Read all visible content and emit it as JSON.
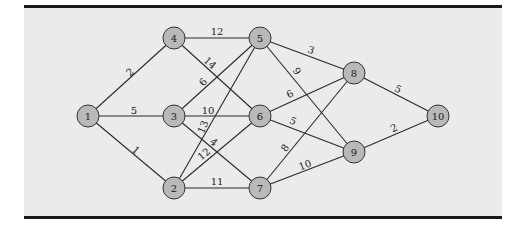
{
  "diagram": {
    "type": "network-graph",
    "colors": {
      "background": "#ebebeb",
      "node_fill": "#b9b9b9",
      "node_stroke": "#333333",
      "edge": "#2a2a2a",
      "rule": "#1a1a1a"
    },
    "nodes": [
      {
        "id": "1",
        "label": "1",
        "x": 88,
        "y": 116
      },
      {
        "id": "2",
        "label": "2",
        "x": 174,
        "y": 188
      },
      {
        "id": "3",
        "label": "3",
        "x": 174,
        "y": 116
      },
      {
        "id": "4",
        "label": "4",
        "x": 174,
        "y": 38
      },
      {
        "id": "5",
        "label": "5",
        "x": 260,
        "y": 38
      },
      {
        "id": "6",
        "label": "6",
        "x": 260,
        "y": 116
      },
      {
        "id": "7",
        "label": "7",
        "x": 260,
        "y": 188
      },
      {
        "id": "8",
        "label": "8",
        "x": 354,
        "y": 73
      },
      {
        "id": "9",
        "label": "9",
        "x": 354,
        "y": 152
      },
      {
        "id": "10",
        "label": "10",
        "x": 438,
        "y": 116
      }
    ],
    "edges": [
      {
        "from": "1",
        "to": "4",
        "weight": "2",
        "lx": 130,
        "ly": 72,
        "rot": -40
      },
      {
        "from": "1",
        "to": "3",
        "weight": "5",
        "lx": 134,
        "ly": 110,
        "rot": 0
      },
      {
        "from": "1",
        "to": "2",
        "weight": "1",
        "lx": 136,
        "ly": 150,
        "rot": 40
      },
      {
        "from": "4",
        "to": "5",
        "weight": "12",
        "lx": 217,
        "ly": 31,
        "rot": 0
      },
      {
        "from": "4",
        "to": "6",
        "weight": "14",
        "lx": 210,
        "ly": 63,
        "rot": 42
      },
      {
        "from": "3",
        "to": "5",
        "weight": "6",
        "lx": 203,
        "ly": 82,
        "rot": -48
      },
      {
        "from": "3",
        "to": "6",
        "weight": "10",
        "lx": 208,
        "ly": 110,
        "rot": 0
      },
      {
        "from": "3",
        "to": "7",
        "weight": "4",
        "lx": 214,
        "ly": 142,
        "rot": 40
      },
      {
        "from": "2",
        "to": "5",
        "weight": "13",
        "lx": 203,
        "ly": 127,
        "rot": -68
      },
      {
        "from": "2",
        "to": "6",
        "weight": "12",
        "lx": 204,
        "ly": 154,
        "rot": -40
      },
      {
        "from": "2",
        "to": "7",
        "weight": "11",
        "lx": 217,
        "ly": 181,
        "rot": 0
      },
      {
        "from": "5",
        "to": "8",
        "weight": "3",
        "lx": 311,
        "ly": 50,
        "rot": 18
      },
      {
        "from": "5",
        "to": "9",
        "weight": "9",
        "lx": 297,
        "ly": 71,
        "rot": 55
      },
      {
        "from": "6",
        "to": "8",
        "weight": "6",
        "lx": 290,
        "ly": 94,
        "rot": -28
      },
      {
        "from": "6",
        "to": "9",
        "weight": "5",
        "lx": 293,
        "ly": 121,
        "rot": 25
      },
      {
        "from": "7",
        "to": "8",
        "weight": "8",
        "lx": 285,
        "ly": 148,
        "rot": -55
      },
      {
        "from": "7",
        "to": "9",
        "weight": "10",
        "lx": 305,
        "ly": 165,
        "rot": -20
      },
      {
        "from": "8",
        "to": "10",
        "weight": "5",
        "lx": 398,
        "ly": 89,
        "rot": 25
      },
      {
        "from": "9",
        "to": "10",
        "weight": "2",
        "lx": 394,
        "ly": 128,
        "rot": -25
      }
    ]
  }
}
